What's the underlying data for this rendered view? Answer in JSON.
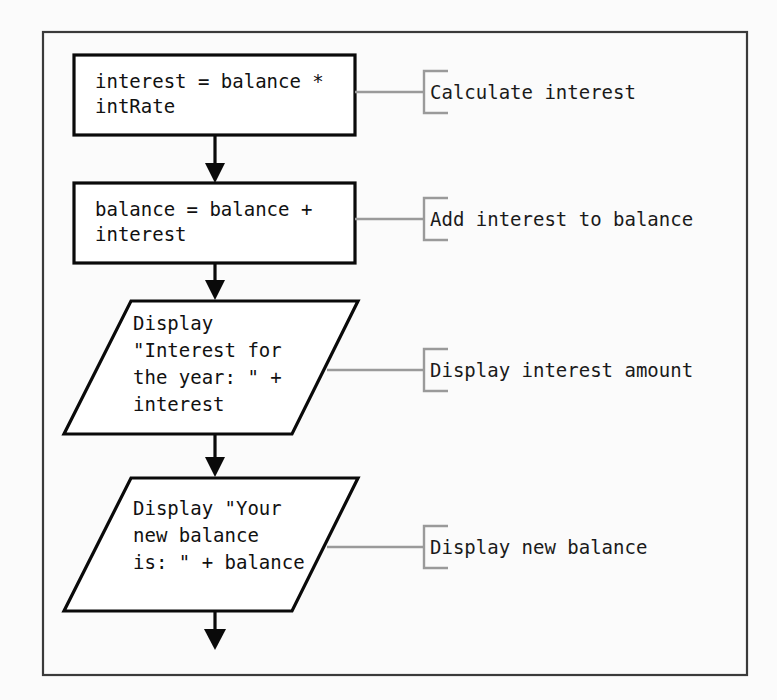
{
  "figure": {
    "name": "flowchart-interest-calculation",
    "background_color": "#fbfbfb",
    "frame_color": "#3a3a3a",
    "shape_stroke_color": "#0a0a0a",
    "annotation_color": "#9a9a9a"
  },
  "nodes": [
    {
      "id": "process-interest",
      "type": "process",
      "lines": [
        "interest = balance *",
        "intRate"
      ]
    },
    {
      "id": "process-balance",
      "type": "process",
      "lines": [
        "balance = balance +",
        "interest"
      ]
    },
    {
      "id": "output-interest",
      "type": "input-output",
      "lines": [
        "Display",
        "\"Interest for",
        "the year: \" +",
        "interest"
      ]
    },
    {
      "id": "output-balance",
      "type": "input-output",
      "lines": [
        "Display \"Your",
        "new balance",
        "is: \" + balance"
      ]
    }
  ],
  "annotations": [
    {
      "id": "annot-calculate-interest",
      "label": "Calculate interest",
      "for": "process-interest"
    },
    {
      "id": "annot-add-interest",
      "label": "Add interest to balance",
      "for": "process-balance"
    },
    {
      "id": "annot-display-interest",
      "label": "Display interest amount",
      "for": "output-interest"
    },
    {
      "id": "annot-display-balance",
      "label": "Display new balance",
      "for": "output-balance"
    }
  ],
  "connectors": [
    {
      "id": "arrow-1",
      "from": "process-interest",
      "to": "process-balance"
    },
    {
      "id": "arrow-2",
      "from": "process-balance",
      "to": "output-interest"
    },
    {
      "id": "arrow-3",
      "from": "output-interest",
      "to": "output-balance"
    },
    {
      "id": "arrow-4",
      "from": "output-balance",
      "to": ""
    }
  ]
}
